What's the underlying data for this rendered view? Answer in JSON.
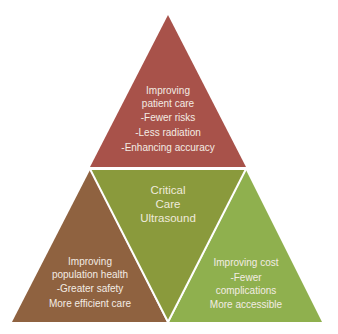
{
  "colors": {
    "top": "#a8524a",
    "center": "#8a9a3c",
    "left": "#8f6240",
    "right": "#8fb04e",
    "divider": "#ffffff",
    "text": "#f3ece4"
  },
  "center": {
    "lines": [
      "Critical",
      "Care",
      "Ultrasound"
    ]
  },
  "top": {
    "heading": [
      "Improving",
      "patient care"
    ],
    "items": [
      "-Fewer risks",
      "-Less radiation",
      "-Enhancing accuracy"
    ]
  },
  "left": {
    "heading": [
      "Improving",
      "population health"
    ],
    "items": [
      "-Greater safety",
      "More efficient care"
    ]
  },
  "right": {
    "heading": [
      "Improving cost"
    ],
    "items": [
      "-Fewer",
      "complications",
      "More accessible"
    ]
  }
}
